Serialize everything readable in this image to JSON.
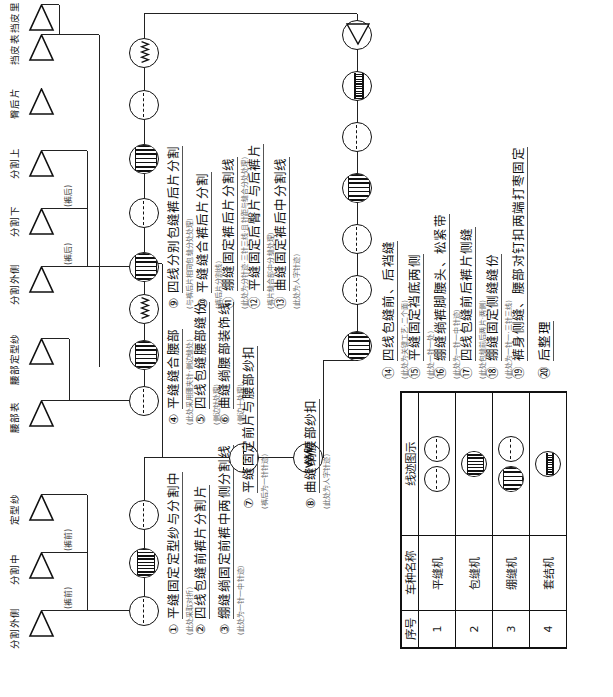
{
  "diagram": {
    "orientation": "rotated-90-ccw"
  },
  "materials": [
    {
      "id": "m1",
      "label": "分割外侧",
      "group": "(裤前)"
    },
    {
      "id": "m2",
      "label": "分割中",
      "group": "(裤前)"
    },
    {
      "id": "m3",
      "label": "定型纱",
      "group": ""
    },
    {
      "id": "m4",
      "label": "腰部表",
      "group": ""
    },
    {
      "id": "m5",
      "label": "腰部定型纱",
      "group": ""
    },
    {
      "id": "m6",
      "label": "分割外侧",
      "group": "(裤后)"
    },
    {
      "id": "m7",
      "label": "分割下",
      "group": "(裤后)"
    },
    {
      "id": "m8",
      "label": "分割上",
      "group": "(裤后)"
    },
    {
      "id": "m9",
      "label": "臀后片",
      "group": ""
    },
    {
      "id": "m10",
      "label": "挡皮表",
      "group": ""
    },
    {
      "id": "m11",
      "label": "挡皮里",
      "group": ""
    }
  ],
  "machines": [
    {
      "key": "flat",
      "name": "平缝机",
      "symbol": "dashed-circle"
    },
    {
      "key": "overlock",
      "name": "包缝机",
      "symbol": "hatched-circle"
    },
    {
      "key": "coverstitch",
      "name": "绷缝机",
      "symbol": "wide-hatched-circle"
    },
    {
      "key": "bartack",
      "name": "套结机",
      "symbol": "barred-circle"
    }
  ],
  "steps": [
    {
      "no": "①",
      "title": "平缝固定定型纱与分割中",
      "note": "(此处采取对折)",
      "machine": "flat"
    },
    {
      "no": "②",
      "title": "四线包缝前裤片分割片",
      "note": "(裤山上一针一)",
      "machine": "overlock"
    },
    {
      "no": "③",
      "title": "绷缝绱固定前裤中两侧分割线",
      "note": "(此处为一针一中针迹)",
      "machine": "coverstitch"
    },
    {
      "no": "④",
      "title": "平缝缝合腰部",
      "note": "(此处采用腰夹针·侧边缝处)",
      "machine": "flat"
    },
    {
      "no": "⑤",
      "title": "四线包缝腰部缝份",
      "note": "(侧边针处理)",
      "machine": "overlock"
    },
    {
      "no": "⑥",
      "title": "曲缝绱腰部装饰线",
      "note": "(侧边十处理)",
      "machine": "zigzag"
    },
    {
      "no": "⑦",
      "title": "平缝固定前片与腰部纱扣",
      "note": "(裤后为一针针迹)",
      "machine": "flat"
    },
    {
      "no": "⑧",
      "title": "曲缝绱腰部纱扣",
      "note": "(此处为人字针迹)",
      "machine": "zigzag"
    },
    {
      "no": "⑨",
      "title": "四线分别包缝裤后片分割",
      "note": "(与裤后片相同包缝分处处理)",
      "machine": "overlock"
    },
    {
      "no": "⑩",
      "title": "平缝缝合裤后片分割",
      "note": "(裤后片分割线)",
      "machine": "flat"
    },
    {
      "no": "⑪",
      "title": "绷缝固定裤后片分割线",
      "note": "(此处为分针迹·三针三线·且针距与缝合分处处理)",
      "machine": "coverstitch"
    },
    {
      "no": "⑫",
      "title": "平缝固定后臀片与后裤片",
      "note": "(裤片缝合部中分缝处理)",
      "machine": "flat"
    },
    {
      "no": "⑬",
      "title": "曲缝固定裤后中分割线",
      "note": "(此处为人字针迹)",
      "machine": "zigzag"
    },
    {
      "no": "⑭",
      "title": "四线包缝前、后裆缝",
      "note": "(此处为关键工艺·二个面)",
      "machine": "overlock"
    },
    {
      "no": "⑮",
      "title": "平缝固定裆底两侧",
      "note": "(此处一针一处)",
      "machine": "flat"
    },
    {
      "no": "⑯",
      "title": "绷缝绱裤脚腰头、松紧带",
      "note": "(此处为一针一中针迹)",
      "machine": "flat"
    },
    {
      "no": "⑰",
      "title": "四线包缝前后裤片侧缝",
      "note": "(此处包缝前后两片·两侧)",
      "machine": "overlock"
    },
    {
      "no": "⑱",
      "title": "绷缝固定侧缝缝份",
      "note": "(此处为一针一·三针三线)",
      "machine": "flat"
    },
    {
      "no": "⑲",
      "title": "裤身侧缝、腰部对钉扣两端打枣固定",
      "note": "",
      "machine": "bartack"
    },
    {
      "no": "⑳",
      "title": "后整理",
      "note": "",
      "machine": "end"
    }
  ],
  "legend": {
    "headers": [
      "序号",
      "车种名称",
      "线迹图示"
    ],
    "rows": [
      {
        "no": "1",
        "name": "平缝机",
        "symbols": [
          "flat",
          "flat"
        ]
      },
      {
        "no": "2",
        "name": "包缝机",
        "symbols": [
          "overlock"
        ]
      },
      {
        "no": "3",
        "name": "绷缝机",
        "symbols": [
          "coverstitch",
          "flat"
        ]
      },
      {
        "no": "4",
        "name": "套结机",
        "symbols": [
          "bartack"
        ]
      }
    ]
  }
}
